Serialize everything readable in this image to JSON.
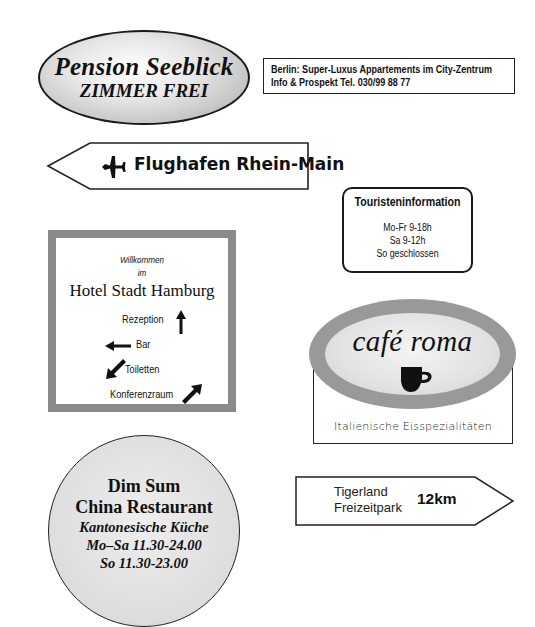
{
  "signs": {
    "pension": {
      "title": "Pension Seeblick",
      "subtitle": "ZIMMER FREI"
    },
    "berlin": {
      "line1": "Berlin: Super-Luxus Appartements im City-Zentrum",
      "line2": "Info & Prospekt Tel. 030/99 88 77"
    },
    "airport": {
      "icon": "airplane-icon",
      "label": "Flughafen Rhein-Main",
      "direction": "left"
    },
    "tourist_info": {
      "title": "Touristeninformation",
      "hours": [
        "Mo-Fr 9-18h",
        "Sa 9-12h",
        "So geschlossen"
      ]
    },
    "hotel": {
      "welcome": "Willkommen",
      "in": "im",
      "name": "Hotel Stadt Hamburg",
      "directions": [
        {
          "label": "Rezeption",
          "arrow": "up"
        },
        {
          "label": "Bar",
          "arrow": "left"
        },
        {
          "label": "Toiletten",
          "arrow": "down-left"
        },
        {
          "label": "Konferenzraum",
          "arrow": "up-right"
        }
      ]
    },
    "cafe": {
      "title": "café roma",
      "icon": "coffee-cup-icon",
      "subtitle": "Italienische Eisspezialitäten"
    },
    "dimsum": {
      "line1": "Dim Sum",
      "line2": "China Restaurant",
      "line3": "Kantonesische Küche",
      "line4": "Mo–Sa 11.30-24.00",
      "line5": "So 11.30-23.00"
    },
    "tigerland": {
      "line1": "Tigerland",
      "line2": "Freizeitpark",
      "distance": "12km",
      "direction": "right"
    }
  },
  "colors": {
    "frame_gray": "#8a8a8a",
    "cafe_ring": "#999999",
    "ink": "#111111"
  }
}
